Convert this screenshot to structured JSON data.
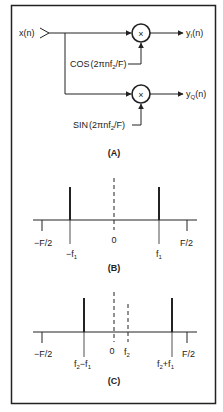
{
  "figure": {
    "border_color": "#222222",
    "background": "#ffffff"
  },
  "panel_a": {
    "caption": "(A)",
    "input_label": "x(n)",
    "mixers": [
      {
        "symbol": "×",
        "lo_label_func": "COS",
        "lo_label_arg": "(2πnf",
        "lo_label_sub": "2",
        "lo_label_end": "/F)",
        "output_label": "y",
        "output_sub": "I",
        "output_end": "(n)"
      },
      {
        "symbol": "×",
        "lo_label_func": "SIN",
        "lo_label_arg": "(2πnf",
        "lo_label_sub": "2",
        "lo_label_end": "/F)",
        "output_label": "y",
        "output_sub": "Q",
        "output_end": "(n)"
      }
    ]
  },
  "panel_b": {
    "caption": "(B)",
    "axis_labels": {
      "neg_half": "−F/2",
      "zero": "0",
      "pos_half": "F/2"
    },
    "lines": [
      {
        "label": "−f",
        "sub": "1",
        "style": "solid"
      },
      {
        "label": "0",
        "sub": "",
        "style": "dashed"
      },
      {
        "label": "f",
        "sub": "1",
        "style": "solid"
      }
    ]
  },
  "panel_c": {
    "caption": "(C)",
    "axis_labels": {
      "neg_half": "−F/2",
      "zero": "0",
      "pos_half": "F/2"
    },
    "lines": [
      {
        "label_parts": [
          "f",
          "2",
          "−f",
          "1"
        ],
        "style": "solid"
      },
      {
        "label": "0",
        "style": "dashed"
      },
      {
        "label_parts": [
          "f",
          "2"
        ],
        "style": "dashed-short"
      },
      {
        "label_parts": [
          "f",
          "2",
          "+f",
          "1"
        ],
        "style": "solid"
      }
    ]
  }
}
